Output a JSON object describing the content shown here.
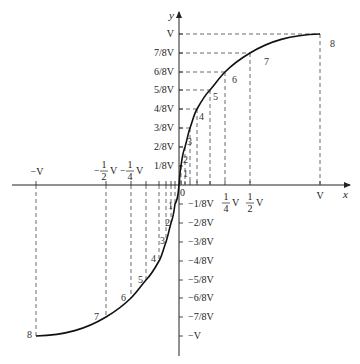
{
  "diagram": {
    "axes": {
      "x_label": "x",
      "y_label": "y",
      "origin_label": "0"
    },
    "y_ticks_positive": [
      "1/8V",
      "2/8V",
      "3/8V",
      "4/8V",
      "5/8V",
      "6/8V",
      "7/8V",
      "V"
    ],
    "y_ticks_negative": [
      "−1/8V",
      "−2/8V",
      "−3/8V",
      "−4/8V",
      "−5/8V",
      "−6/8V",
      "−7/8V",
      "−V"
    ],
    "x_ticks": {
      "neg_V": "−V",
      "neg_half": {
        "sign": "−",
        "num": "1",
        "den": "2",
        "unit": "V"
      },
      "neg_quarter": {
        "sign": "−",
        "num": "1",
        "den": "4",
        "unit": "V"
      },
      "quarter": {
        "num": "1",
        "den": "4",
        "unit": "V"
      },
      "half": {
        "num": "1",
        "den": "2",
        "unit": "V"
      },
      "V": "V"
    },
    "point_labels": [
      "1",
      "2",
      "3",
      "4",
      "5",
      "6",
      "7",
      "8"
    ],
    "colors": {
      "curve": "#111111",
      "axis": "#222222",
      "dash": "#444444"
    }
  }
}
